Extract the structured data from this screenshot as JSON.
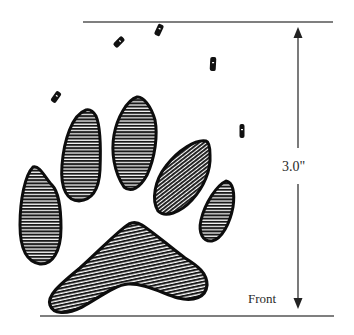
{
  "diagram": {
    "measurement": {
      "label": "3.0\"",
      "direction": "vertical",
      "arrow_heads": [
        "up",
        "down"
      ]
    },
    "orientation_label": "Front",
    "pads": {
      "toes": 5,
      "heel": 1,
      "fill_style": "horizontal hatching"
    },
    "claw_marks": 5,
    "colors": {
      "background": "#ffffff",
      "ink": "#111111",
      "rule_lines": "#555555",
      "text": "#2a2a2a"
    }
  }
}
